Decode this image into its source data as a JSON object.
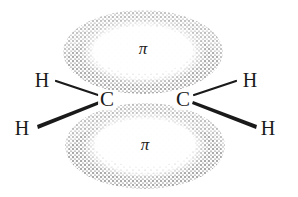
{
  "diagram": {
    "colors": {
      "background": "#ffffff",
      "ink": "#1a1a1a",
      "stipple": "#6e6e6e"
    },
    "lobes": [
      {
        "id": "top",
        "label": "π",
        "cx": 143,
        "cy": 52,
        "rx": 80,
        "ry": 42
      },
      {
        "id": "bottom",
        "label": "π",
        "cx": 145,
        "cy": 146,
        "rx": 80,
        "ry": 43
      }
    ],
    "atoms": [
      {
        "id": "C1",
        "symbol": "C",
        "x": 107,
        "y": 106
      },
      {
        "id": "C2",
        "symbol": "C",
        "x": 183,
        "y": 106
      },
      {
        "id": "H1",
        "symbol": "H",
        "x": 42,
        "y": 86
      },
      {
        "id": "H2",
        "symbol": "H",
        "x": 22,
        "y": 134
      },
      {
        "id": "H3",
        "symbol": "H",
        "x": 250,
        "y": 86
      },
      {
        "id": "H4",
        "symbol": "H",
        "x": 268,
        "y": 134
      }
    ],
    "bonds": [
      {
        "from": "C1",
        "to": "H1",
        "style": "line"
      },
      {
        "from": "C1",
        "to": "H2",
        "style": "wedge"
      },
      {
        "from": "C2",
        "to": "H3",
        "style": "line"
      },
      {
        "from": "C2",
        "to": "H4",
        "style": "wedge"
      }
    ]
  }
}
